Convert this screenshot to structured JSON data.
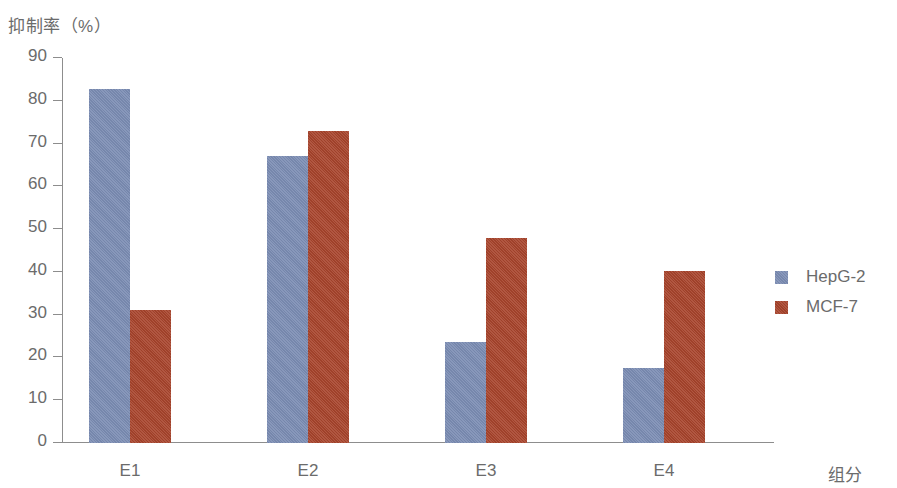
{
  "chart_data": {
    "type": "bar",
    "title": "",
    "subtitle": "",
    "xlabel": "组分",
    "ylabel": "抑制率（%）",
    "categories": [
      "E1",
      "E2",
      "E3",
      "E4"
    ],
    "series": [
      {
        "name": "HepG-2",
        "color": "#7b8cb3",
        "values": [
          82.7,
          67.0,
          23.7,
          17.6
        ]
      },
      {
        "name": "MCF-7",
        "color": "#a8442c",
        "values": [
          31.0,
          73.0,
          48.0,
          40.3
        ]
      }
    ],
    "ylim": [
      0,
      90
    ],
    "ytick_step": 10,
    "yticks": [
      "90",
      "80",
      "70",
      "60",
      "50",
      "40",
      "30",
      "20",
      "10",
      "0"
    ],
    "grid": false,
    "legend_position": "right"
  },
  "legend": {
    "items": [
      {
        "label": "HepG-2",
        "swatch": "legend-swatch-hepg2"
      },
      {
        "label": "MCF-7",
        "swatch": "legend-swatch-mcf7"
      }
    ]
  }
}
